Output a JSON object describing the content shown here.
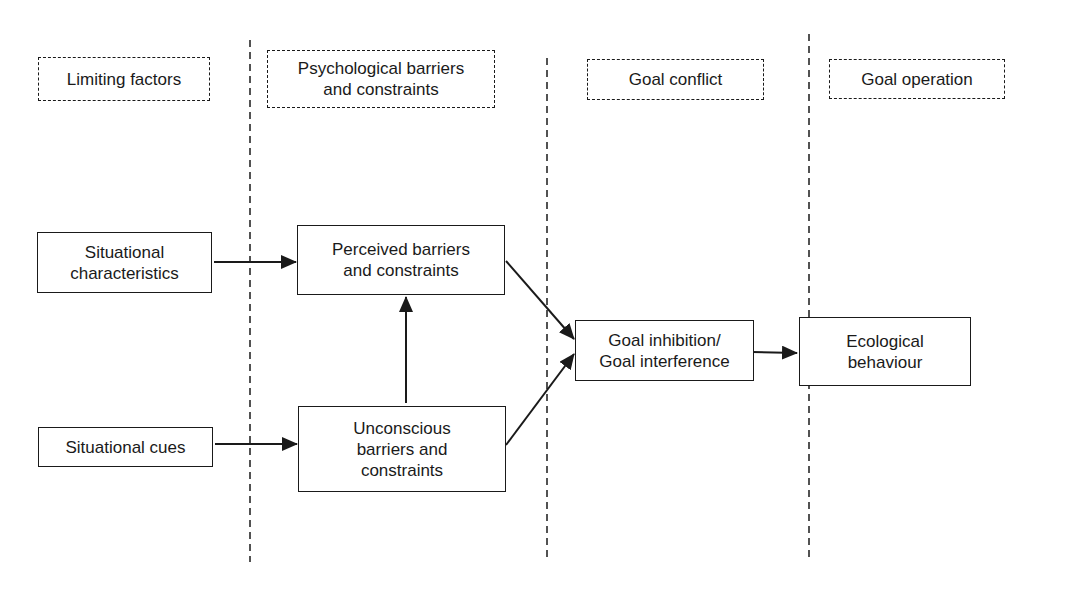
{
  "diagram": {
    "type": "flow-diagram",
    "colors": {
      "line": "#1a1a1a",
      "background": "#ffffff"
    },
    "columns": [
      {
        "id": "limiting",
        "header": "Limiting factors"
      },
      {
        "id": "psych",
        "header": "Psychological barriers\nand constraints"
      },
      {
        "id": "conflict",
        "header": "Goal conflict"
      },
      {
        "id": "operation",
        "header": "Goal operation"
      }
    ],
    "nodes": {
      "situational_characteristics": "Situational\ncharacteristics",
      "situational_cues": "Situational cues",
      "perceived_barriers": "Perceived barriers\nand constraints",
      "unconscious_barriers": "Unconscious\nbarriers and\nconstraints",
      "goal_inhibition": "Goal inhibition/\nGoal interference",
      "ecological_behaviour": "Ecological\nbehaviour"
    },
    "edges": [
      {
        "from": "situational_characteristics",
        "to": "perceived_barriers"
      },
      {
        "from": "situational_cues",
        "to": "unconscious_barriers"
      },
      {
        "from": "unconscious_barriers",
        "to": "perceived_barriers"
      },
      {
        "from": "perceived_barriers",
        "to": "goal_inhibition"
      },
      {
        "from": "unconscious_barriers",
        "to": "goal_inhibition"
      },
      {
        "from": "goal_inhibition",
        "to": "ecological_behaviour"
      }
    ]
  }
}
